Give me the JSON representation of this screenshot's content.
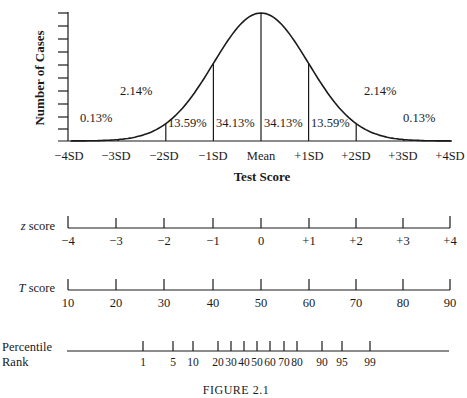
{
  "figure": {
    "caption": "Figure 2.1",
    "caption_display": "FIGURE 2.1"
  },
  "chart_data": {
    "type": "area",
    "title": "",
    "xlabel": "Test Score",
    "ylabel": "Number of Cases",
    "x_ticks": [
      "−4SD",
      "−3SD",
      "−2SD",
      "−1SD",
      "Mean",
      "+1SD",
      "+2SD",
      "+3SD",
      "+4SD"
    ],
    "x_range": [
      -4,
      4
    ],
    "y_tick_count": 10,
    "bands": [
      {
        "from": "-4SD",
        "to": "-3SD",
        "percent": "0.13%"
      },
      {
        "from": "-3SD",
        "to": "-2SD",
        "percent": "2.14%"
      },
      {
        "from": "-2SD",
        "to": "-1SD",
        "percent": "13.59%"
      },
      {
        "from": "-1SD",
        "to": "Mean",
        "percent": "34.13%"
      },
      {
        "from": "Mean",
        "to": "+1SD",
        "percent": "34.13%"
      },
      {
        "from": "+1SD",
        "to": "+2SD",
        "percent": "13.59%"
      },
      {
        "from": "+2SD",
        "to": "+3SD",
        "percent": "2.14%"
      },
      {
        "from": "+3SD",
        "to": "+4SD",
        "percent": "0.13%"
      }
    ],
    "scales": [
      {
        "name": "z score",
        "values": [
          "−4",
          "−3",
          "−2",
          "−1",
          "0",
          "+1",
          "+2",
          "+3",
          "+4"
        ]
      },
      {
        "name": "T score",
        "values": [
          "10",
          "20",
          "30",
          "40",
          "50",
          "60",
          "70",
          "80",
          "90"
        ]
      },
      {
        "name": "Percentile Rank",
        "values": [
          "1",
          "5",
          "10",
          "20",
          "30",
          "40",
          "50",
          "60",
          "70",
          "80",
          "90",
          "95",
          "99"
        ]
      }
    ]
  },
  "labels": {
    "y_axis": "Number of Cases",
    "x_axis": "Test Score",
    "sd_ticks": [
      "−4SD",
      "−3SD",
      "−2SD",
      "−1SD",
      "Mean",
      "+1SD",
      "+2SD",
      "+3SD",
      "+4SD"
    ],
    "pct": [
      "0.13%",
      "2.14%",
      "13.59%",
      "34.13%",
      "34.13%",
      "13.59%",
      "2.14%",
      "0.13%"
    ],
    "z_label_italic": "z",
    "z_label_rest": " score",
    "z_values": [
      "−4",
      "−3",
      "−2",
      "−1",
      "0",
      "+1",
      "+2",
      "+3",
      "+4"
    ],
    "t_label_italic": "T",
    "t_label_rest": " score",
    "t_values": [
      "10",
      "20",
      "30",
      "40",
      "50",
      "60",
      "70",
      "80",
      "90"
    ],
    "pr_label_1": "Percentile",
    "pr_label_2": "Rank",
    "pr_values": [
      "1",
      "5",
      "10",
      "20",
      "30",
      "40",
      "50",
      "60",
      "70",
      "80",
      "90",
      "95",
      "99"
    ]
  }
}
